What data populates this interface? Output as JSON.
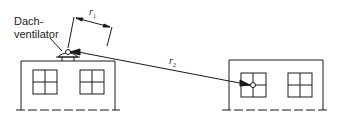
{
  "diagram": {
    "ventilator_label_line1": "Dach-",
    "ventilator_label_line2": "ventilator",
    "r1_label": "r",
    "r1_sub": "1",
    "r2_label": "r",
    "r2_sub": "2",
    "line_color": "#1a1a1a",
    "buildings": [
      {
        "name": "source-building",
        "windows": 2,
        "has_roof_ventilator": true
      },
      {
        "name": "receiver-building",
        "windows": 2,
        "has_measurement_point": true
      }
    ]
  }
}
